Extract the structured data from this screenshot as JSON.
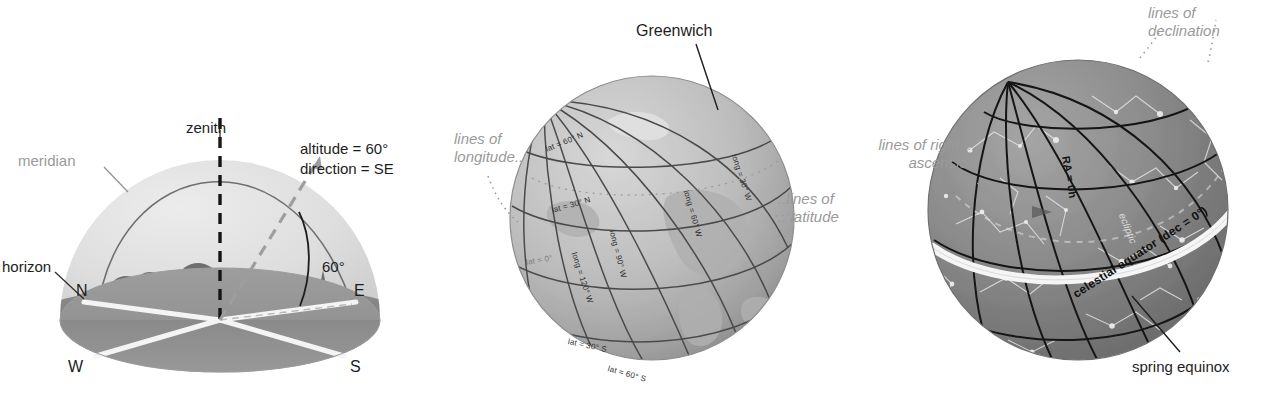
{
  "figure": {
    "panels": [
      {
        "id": "horizon-dome",
        "name": "local horizon coordinate dome",
        "labels": {
          "zenith": "zenith",
          "meridian": "meridian",
          "horizon": "horizon",
          "altitude": "altitude = 60°",
          "direction": "direction = SE",
          "angle": "60°",
          "compass": {
            "north": "N",
            "east": "E",
            "south": "S",
            "west": "W"
          }
        }
      },
      {
        "id": "earth-globe",
        "name": "earth latitude and longitude globe",
        "labels": {
          "greenwich": "Greenwich",
          "lines_of_longitude": "lines of\nlongitude..",
          "lines_of_latitude": "..lines of\n.. latitude"
        },
        "gridlines": {
          "latitude": [
            "lat = 60° N",
            "lat = 30° N",
            "lat = 0°",
            "lat = 30° S",
            "lat = 60° S"
          ],
          "longitude": [
            "long = 30° W",
            "long = 60° W",
            "long = 90° W",
            "long = 120° W"
          ]
        }
      },
      {
        "id": "celestial-sphere",
        "name": "celestial sphere right ascension and declination",
        "labels": {
          "lines_of_declination": "lines of\ndeclination",
          "lines_of_right_ascension": "lines of right....\nascension",
          "spring_equinox": "spring equinox",
          "ra_zero": "RA = 0h",
          "celestial_equator": "celestial equator (dec = 0°)",
          "ecliptic": "ecliptic"
        }
      }
    ]
  },
  "colors": {
    "ink": "#1d1d1d",
    "gray_label": "#9a9a9a",
    "dome_fill": "#dcdcdc",
    "ground_fill": "#8e8e8e",
    "globe_light": "#c9c9c9",
    "globe_dark": "#8f8f8f",
    "sky_sphere": "#7e7e7e",
    "grid_line": "#3a3a3a",
    "equator_white": "#f5f5f5"
  }
}
